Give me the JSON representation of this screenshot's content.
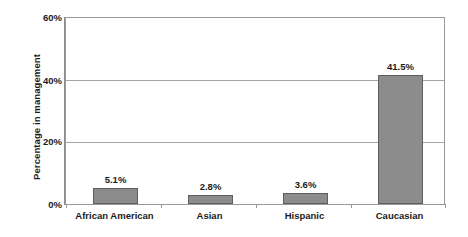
{
  "chart_data": {
    "type": "bar",
    "title": "",
    "subtitle": "",
    "xlabel": "",
    "ylabel": "Percentage in management",
    "categories": [
      "African American",
      "Asian",
      "Hispanic",
      "Caucasian"
    ],
    "values": [
      5.1,
      2.8,
      3.6,
      41.5
    ],
    "data_labels": [
      "5.1%",
      "2.8%",
      "3.6%",
      "41.5%"
    ],
    "ylim": [
      0,
      60
    ],
    "ytick_values": [
      0,
      20,
      40,
      60
    ],
    "ytick_labels": [
      "0%",
      "20%",
      "40%",
      "60%"
    ],
    "grid": true,
    "grid_axis": "y",
    "legend": false,
    "legend_position": "none",
    "series": [
      {
        "name": "Percentage in management",
        "values": [
          5.1,
          2.8,
          3.6,
          41.5
        ]
      }
    ],
    "colors": {
      "bar_fill": "#8c8c8c",
      "bar_border": "#5e5e5e",
      "gridline": "#a6a6a6",
      "plot_border": "#9a9a9a",
      "text": "#1b1b1b",
      "background": "#ffffff"
    }
  }
}
